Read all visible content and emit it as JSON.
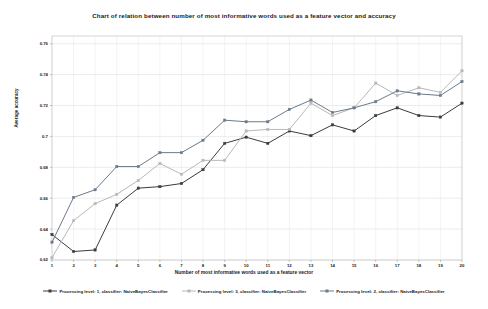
{
  "chart_data": {
    "type": "line",
    "title": "Chart of relation between number of most informative words used as a feature vector and accuracy",
    "xlabel": "Number of most informative words used as a feature vector",
    "ylabel": "Average accuracy",
    "grid": true,
    "legend_position": "bottom",
    "x": [
      1,
      2,
      3,
      4,
      5,
      6,
      7,
      8,
      9,
      10,
      11,
      12,
      13,
      14,
      15,
      16,
      17,
      18,
      19,
      20
    ],
    "xtick_labels": [
      "1",
      "2",
      "3",
      "4",
      "5",
      "6",
      "7",
      "8",
      "9",
      "10",
      "11",
      "12",
      "13",
      "14",
      "15",
      "16",
      "17",
      "18",
      "19",
      "20"
    ],
    "ytick_labels": [
      "0.62",
      "0.64",
      "0.66",
      "0.68",
      "0.7",
      "0.72",
      "0.74",
      "0.76"
    ],
    "ytick_values": [
      0.62,
      0.64,
      0.66,
      0.68,
      0.7,
      0.72,
      0.74,
      0.76
    ],
    "xlim": [
      1,
      20
    ],
    "ylim": [
      0.62,
      0.765
    ],
    "series": [
      {
        "name": "Processing level: 1, classifier: NaiveBayesClassifier",
        "color": "#3b3b3b",
        "marker": "square",
        "values": [
          0.6365,
          0.6255,
          0.6265,
          0.6555,
          0.6665,
          0.6675,
          0.6695,
          0.6785,
          0.6955,
          0.6995,
          0.6955,
          0.7035,
          0.7005,
          0.7075,
          0.7035,
          0.7135,
          0.7185,
          0.7135,
          0.7125,
          0.7215
        ]
      },
      {
        "name": "Processing level: 3, classifier: NaiveBayesClassifier",
        "color": "#b8b8b8",
        "marker": "square",
        "values": [
          0.6215,
          0.6455,
          0.6565,
          0.6625,
          0.6715,
          0.6825,
          0.6755,
          0.6845,
          0.6845,
          0.7035,
          0.7045,
          0.7045,
          0.7215,
          0.7135,
          0.7185,
          0.7345,
          0.7265,
          0.7315,
          0.7285,
          0.7425
        ]
      },
      {
        "name": "Processing level: 2, classifier: NaiveBayesClassifier",
        "color": "#6b7a8a",
        "marker": "square",
        "values": [
          0.6315,
          0.6605,
          0.6655,
          0.6805,
          0.6805,
          0.6895,
          0.6895,
          0.6975,
          0.7105,
          0.7095,
          0.7095,
          0.7175,
          0.7235,
          0.7155,
          0.7185,
          0.7225,
          0.7295,
          0.7275,
          0.7265,
          0.7355
        ]
      }
    ]
  },
  "plot": {
    "left": 52,
    "right": 462,
    "top": 36,
    "bottom": 260
  }
}
